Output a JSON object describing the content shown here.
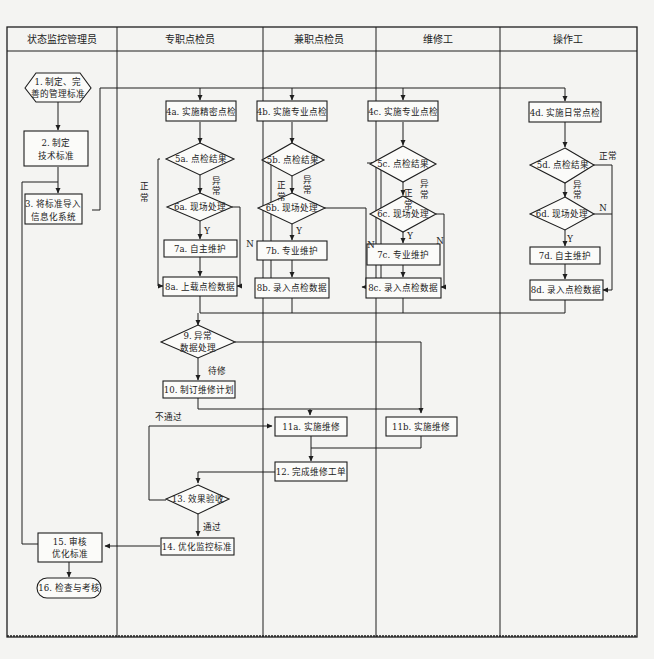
{
  "lanes": [
    {
      "id": "lane-monitor-manager",
      "label": "状态监控管理员"
    },
    {
      "id": "lane-dedicated-inspector",
      "label": "专职点检员"
    },
    {
      "id": "lane-parttime-inspector",
      "label": "兼职点检员"
    },
    {
      "id": "lane-maintenance-worker",
      "label": "维修工"
    },
    {
      "id": "lane-operator",
      "label": "操作工"
    }
  ],
  "nodes": {
    "n1": {
      "line1": "1. 制定、完",
      "line2": "善的管理标准",
      "shape": "hexagon"
    },
    "n2": {
      "line1": "2. 制定",
      "line2": "技术标准",
      "shape": "rect"
    },
    "n3": {
      "line1": "3. 将标准导入",
      "line2": "信息化系统",
      "shape": "rect"
    },
    "n4a": {
      "label": "4a. 实施精密点检",
      "shape": "rect"
    },
    "n4b": {
      "label": "4b. 实施专业点检",
      "shape": "rect"
    },
    "n4c": {
      "label": "4c. 实施专业点检",
      "shape": "rect"
    },
    "n4d": {
      "label": "4d. 实施日常点检",
      "shape": "rect"
    },
    "n5a": {
      "label": "5a. 点检结果",
      "shape": "diamond"
    },
    "n5b": {
      "label": "5b. 点检结果",
      "shape": "diamond"
    },
    "n5c": {
      "label": "5c. 点检结果",
      "shape": "diamond"
    },
    "n5d": {
      "label": "5d. 点检结果",
      "shape": "diamond"
    },
    "n6a": {
      "label": "6a. 现场处理",
      "shape": "diamond"
    },
    "n6b": {
      "label": "6b. 现场处理",
      "shape": "diamond"
    },
    "n6c": {
      "label": "6c. 现场处理",
      "shape": "diamond"
    },
    "n6d": {
      "label": "6d. 现场处理",
      "shape": "diamond"
    },
    "n7a": {
      "label": "7a. 自主维护",
      "shape": "rect"
    },
    "n7b": {
      "label": "7b. 专业维护",
      "shape": "rect"
    },
    "n7c": {
      "label": "7c. 专业维护",
      "shape": "rect"
    },
    "n7d": {
      "label": "7d. 自主维护",
      "shape": "rect"
    },
    "n8a": {
      "label": "8a. 上载点检数据",
      "shape": "rect"
    },
    "n8b": {
      "label": "8b. 录入点检数据",
      "shape": "rect"
    },
    "n8c": {
      "label": "8c. 录入点检数据",
      "shape": "rect"
    },
    "n8d": {
      "label": "8d. 录入点检数据",
      "shape": "rect"
    },
    "n9": {
      "line1": "9. 异常",
      "line2": "数据处理",
      "shape": "diamond"
    },
    "n10": {
      "label": "10. 制订维修计划",
      "shape": "rect"
    },
    "n11a": {
      "label": "11a. 实施维修",
      "shape": "rect"
    },
    "n11b": {
      "label": "11b. 实施维修",
      "shape": "rect"
    },
    "n12": {
      "label": "12. 完成维修工单",
      "shape": "rect"
    },
    "n13": {
      "label": "13. 效果验收",
      "shape": "diamond"
    },
    "n14": {
      "label": "14. 优化监控标准",
      "shape": "rect"
    },
    "n15": {
      "line1": "15. 审核",
      "line2": "优化标准",
      "shape": "rect"
    },
    "n16": {
      "label": "16. 检查与考核",
      "shape": "rounded"
    }
  },
  "edge_labels": {
    "normal_1": "正",
    "normal_2": "常",
    "normal": "正常",
    "abnormal_1": "异",
    "abnormal_2": "常",
    "yes": "Y",
    "no": "N",
    "pending_repair": "待修",
    "not_passed": "不通过",
    "passed": "通过"
  },
  "colors": {
    "line": "#1e1e1e",
    "background": "#f4f4f2",
    "node_fill": "#fbfbf9"
  }
}
